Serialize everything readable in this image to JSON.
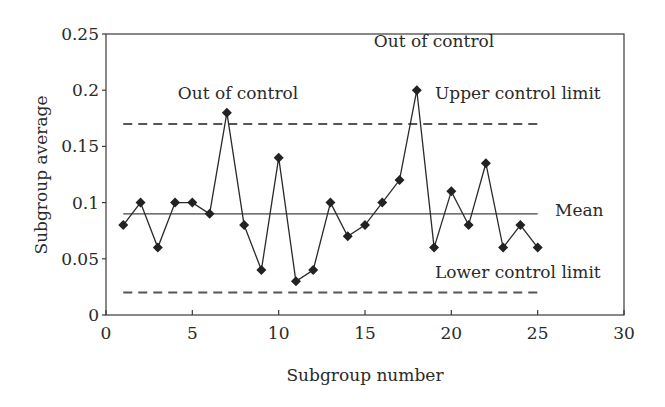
{
  "chart_data": {
    "type": "line",
    "title": "",
    "xlabel": "Subgroup number",
    "ylabel": "Subgroup average",
    "xlim": [
      0,
      30
    ],
    "ylim": [
      0,
      0.25
    ],
    "x_ticks": [
      "0",
      "5",
      "10",
      "15",
      "20",
      "25",
      "30"
    ],
    "y_ticks": [
      "0",
      "0.05",
      "0.1",
      "0.15",
      "0.2",
      "0.25"
    ],
    "grid": false,
    "legend": null,
    "series": [
      {
        "name": "Subgroup average",
        "marker": "diamond",
        "x": [
          1,
          2,
          3,
          4,
          5,
          6,
          7,
          8,
          9,
          10,
          11,
          12,
          13,
          14,
          15,
          16,
          17,
          18,
          19,
          20,
          21,
          22,
          23,
          24,
          25
        ],
        "values": [
          0.08,
          0.1,
          0.06,
          0.1,
          0.1,
          0.09,
          0.18,
          0.08,
          0.04,
          0.14,
          0.03,
          0.04,
          0.1,
          0.07,
          0.08,
          0.1,
          0.12,
          0.2,
          0.06,
          0.11,
          0.08,
          0.135,
          0.06,
          0.08,
          0.06
        ]
      }
    ],
    "reference_lines": [
      {
        "name": "Upper control limit",
        "value": 0.17,
        "style": "dashed",
        "x_range": [
          1,
          25
        ]
      },
      {
        "name": "Mean",
        "value": 0.09,
        "style": "solid",
        "x_range": [
          1,
          25
        ]
      },
      {
        "name": "Lower control limit",
        "value": 0.02,
        "style": "dashed",
        "x_range": [
          1,
          25
        ]
      }
    ],
    "annotations": [
      {
        "text": "Out of control",
        "x": 7,
        "y": 0.18
      },
      {
        "text": "Out of control",
        "x": 18,
        "y": 0.2
      },
      {
        "text": "Upper control limit"
      },
      {
        "text": "Mean"
      },
      {
        "text": "Lower control limit"
      }
    ]
  },
  "labels": {
    "xlabel": "Subgroup number",
    "ylabel": "Subgroup average",
    "ucl": "Upper control limit",
    "mean": "Mean",
    "lcl": "Lower control limit",
    "ooc1": "Out of control",
    "ooc2": "Out of control"
  },
  "ticks": {
    "x": [
      "0",
      "5",
      "10",
      "15",
      "20",
      "25",
      "30"
    ],
    "y": [
      "0",
      "0.05",
      "0.1",
      "0.15",
      "0.2",
      "0.25"
    ]
  }
}
